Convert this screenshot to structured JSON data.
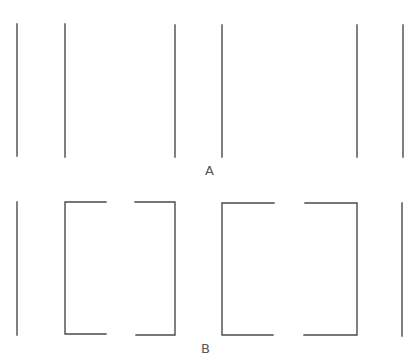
{
  "diagram": {
    "panels": [
      {
        "label": "A",
        "description": "six separated vertical lines",
        "vertical_lines_x": [
          17,
          65,
          175,
          222,
          357,
          403
        ],
        "y_range": [
          24,
          157
        ]
      },
      {
        "label": "B",
        "description": "two single lines with two bracket pairs (open rectangles with gaps at top and bottom centers)",
        "single_lines_x": [
          17,
          402
        ],
        "brackets": [
          {
            "left_x": 65,
            "left_inner_x": 106,
            "right_inner_x": 135,
            "right_x": 175
          },
          {
            "left_x": 222,
            "left_inner_x": 274,
            "right_inner_x": 305,
            "right_x": 357
          }
        ],
        "y_range": [
          202,
          335
        ]
      }
    ],
    "line_color": "#4a4a4a"
  }
}
